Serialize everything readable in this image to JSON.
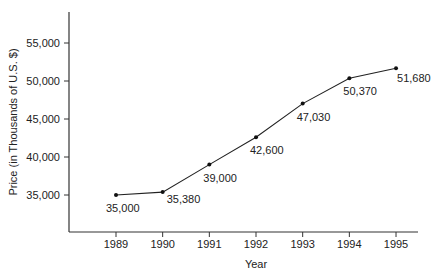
{
  "chart_data": {
    "type": "line",
    "title": "",
    "xlabel": "Year",
    "ylabel": "Price (in Thousands of U.S. $)",
    "categories": [
      "1989",
      "1990",
      "1991",
      "1992",
      "1993",
      "1994",
      "1995"
    ],
    "series": [
      {
        "name": "Price",
        "values": [
          35000,
          35380,
          39000,
          42600,
          47030,
          50370,
          51680
        ]
      }
    ],
    "data_labels": [
      "35,000",
      "35,380",
      "39,000",
      "42,600",
      "47,030",
      "50,370",
      "51,680"
    ],
    "yticks": [
      35000,
      40000,
      45000,
      50000,
      55000
    ],
    "ytick_labels": [
      "35,000",
      "40,000",
      "45,000",
      "50,000",
      "55,000"
    ],
    "ylim": [
      31000,
      57500
    ],
    "grid": false,
    "legend": null,
    "colors": {
      "line": "#222222",
      "axis": "#333333",
      "text": "#222222"
    }
  }
}
